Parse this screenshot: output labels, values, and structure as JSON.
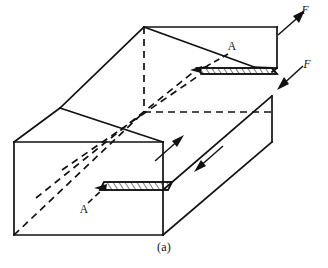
{
  "figure": {
    "caption": "(a)",
    "kind": "isometric-block-shear-diagram",
    "colors": {
      "line": "#111111",
      "background": "#ffffff",
      "hatch": "#111111"
    },
    "labels": {
      "force_top": "F",
      "force_bottom": "F",
      "section_upper": "A",
      "section_lower": "A"
    },
    "label_positions": {
      "force_top": {
        "x": 309,
        "y": 14
      },
      "force_bottom": {
        "x": 310,
        "y": 68
      },
      "section_upper": {
        "x": 231,
        "y": 48
      },
      "section_lower": {
        "x": 84,
        "y": 212
      }
    },
    "annotations": {
      "section_plane_name": "A-A",
      "force_symbol": "F",
      "shear_arrow_count": 2,
      "force_arrow_count": 2,
      "hatched_band_count": 2
    },
    "geometry": {
      "solid_edges": [
        [
          14,
          142,
          14,
          235
        ],
        [
          14,
          235,
          163,
          235
        ],
        [
          163,
          235,
          163,
          190
        ],
        [
          14,
          142,
          163,
          142
        ],
        [
          163,
          142,
          163,
          190
        ],
        [
          14,
          142,
          60,
          108
        ],
        [
          60,
          108,
          144,
          27
        ],
        [
          144,
          27,
          277,
          27
        ],
        [
          277,
          27,
          277,
          68
        ],
        [
          272,
          72,
          272,
          142
        ],
        [
          163,
          235,
          272,
          142
        ],
        [
          163,
          190,
          272,
          96
        ],
        [
          144,
          27,
          254,
          68
        ],
        [
          254,
          68,
          272,
          72
        ],
        [
          272,
          96,
          277,
          68
        ],
        [
          60,
          108,
          163,
          142
        ]
      ],
      "hidden_edges": [
        [
          144,
          27,
          144,
          112
        ],
        [
          144,
          112,
          272,
          112
        ],
        [
          14,
          235,
          144,
          112
        ],
        [
          60,
          108,
          190,
          -10
        ],
        [
          36,
          198,
          163,
          92
        ]
      ],
      "upper_hatch_band": [
        [
          196,
          68
        ],
        [
          272,
          68
        ],
        [
          277,
          74
        ],
        [
          201,
          74
        ]
      ],
      "lower_hatch_band": [
        [
          97,
          190
        ],
        [
          168,
          190
        ],
        [
          172,
          183
        ],
        [
          101,
          183
        ]
      ]
    }
  }
}
